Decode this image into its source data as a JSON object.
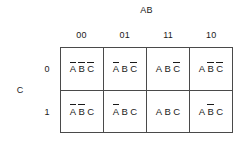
{
  "diagram": {
    "type": "karnaugh-map",
    "top_variable_label": "AB",
    "left_variable_label": "C",
    "column_headers": [
      "00",
      "01",
      "11",
      "10"
    ],
    "row_headers": [
      "0",
      "1"
    ],
    "cells": [
      [
        {
          "text": "A B C",
          "literals": [
            {
              "name": "A",
              "negated": true
            },
            {
              "name": "B",
              "negated": true
            },
            {
              "name": "C",
              "negated": true
            }
          ]
        },
        {
          "text": "A B C",
          "literals": [
            {
              "name": "A",
              "negated": true
            },
            {
              "name": "B",
              "negated": false
            },
            {
              "name": "C",
              "negated": true
            }
          ]
        },
        {
          "text": "A B C",
          "literals": [
            {
              "name": "A",
              "negated": false
            },
            {
              "name": "B",
              "negated": false
            },
            {
              "name": "C",
              "negated": true
            }
          ]
        },
        {
          "text": "A B C",
          "literals": [
            {
              "name": "A",
              "negated": false
            },
            {
              "name": "B",
              "negated": true
            },
            {
              "name": "C",
              "negated": true
            }
          ]
        }
      ],
      [
        {
          "text": "A B C",
          "literals": [
            {
              "name": "A",
              "negated": true
            },
            {
              "name": "B",
              "negated": true
            },
            {
              "name": "C",
              "negated": false
            }
          ]
        },
        {
          "text": "A B C",
          "literals": [
            {
              "name": "A",
              "negated": true
            },
            {
              "name": "B",
              "negated": false
            },
            {
              "name": "C",
              "negated": false
            }
          ]
        },
        {
          "text": "A B C",
          "literals": [
            {
              "name": "A",
              "negated": false
            },
            {
              "name": "B",
              "negated": false
            },
            {
              "name": "C",
              "negated": false
            }
          ]
        },
        {
          "text": "A B C",
          "literals": [
            {
              "name": "A",
              "negated": false
            },
            {
              "name": "B",
              "negated": true
            },
            {
              "name": "C",
              "negated": false
            }
          ]
        }
      ]
    ],
    "colors": {
      "background": "#ffffff",
      "text": "#1a1a1a",
      "grid_line": "#4a4a4a"
    }
  }
}
